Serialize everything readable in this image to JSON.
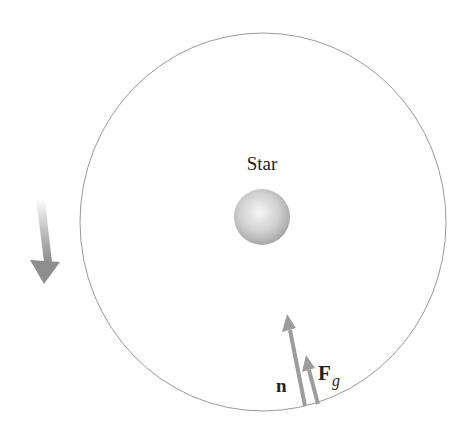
{
  "diagram": {
    "star_label": "Star",
    "normal_force_label": "n",
    "gravity_force_label": "F",
    "gravity_force_subscript": "g",
    "rotation_direction": "counterclockwise",
    "colors": {
      "orbit": "#9a9a9a",
      "arrow": "#9c9c9c",
      "star_light": "#f4f4f4",
      "star_dark": "#a8a8a8",
      "text": "#222222"
    }
  }
}
